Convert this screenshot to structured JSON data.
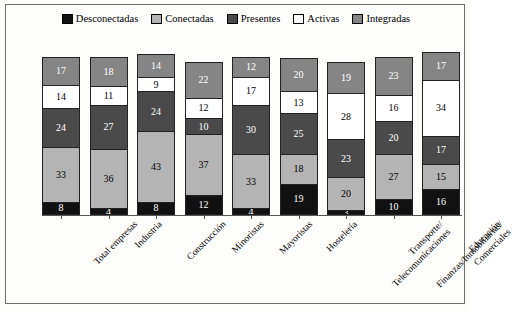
{
  "chart_data": {
    "type": "bar",
    "subtype": "stacked-bar-vertical",
    "title": "",
    "xlabel": "",
    "ylabel": "Datos en porcentaje",
    "ylim": [
      0,
      100
    ],
    "grid": false,
    "legend_position": "top-center",
    "stacking_order_bottom_to_top": [
      "Desconectadas",
      "Conectadas",
      "Presentes",
      "Activas",
      "Integradas"
    ],
    "categories": [
      "Total empresas",
      "Industria",
      "Construcción",
      "Minoristas",
      "Mayoristas",
      "Hostelería",
      "Transporte/ Telecomunicaciones",
      "Finanzas/Inmobiliarias/ Comerciales",
      "Educación"
    ],
    "series": [
      {
        "name": "Desconectadas",
        "color": "#111111",
        "values": [
          8,
          4,
          8,
          12,
          4,
          19,
          3,
          10,
          16
        ]
      },
      {
        "name": "Conectadas",
        "color": "#b4b4b4",
        "values": [
          33,
          36,
          43,
          37,
          33,
          18,
          20,
          27,
          15
        ]
      },
      {
        "name": "Presentes",
        "color": "#4a4a4a",
        "values": [
          24,
          27,
          24,
          10,
          30,
          25,
          23,
          20,
          17
        ]
      },
      {
        "name": "Activas",
        "color": "#ffffff",
        "values": [
          14,
          11,
          9,
          12,
          17,
          13,
          28,
          16,
          34
        ]
      },
      {
        "name": "Integradas",
        "color": "#858585",
        "values": [
          17,
          18,
          14,
          22,
          12,
          20,
          19,
          23,
          17
        ]
      }
    ]
  },
  "legend": {
    "items": [
      {
        "label": "Desconectadas",
        "color": "#111111"
      },
      {
        "label": "Conectadas",
        "color": "#b4b4b4"
      },
      {
        "label": "Presentes",
        "color": "#4a4a4a"
      },
      {
        "label": "Activas",
        "color": "#ffffff"
      },
      {
        "label": "Integradas",
        "color": "#858585"
      }
    ]
  },
  "axes": {
    "y_title": "Datos en porcentaje",
    "x_labels": [
      {
        "line1": "Total empresas",
        "line2": ""
      },
      {
        "line1": "Industria",
        "line2": ""
      },
      {
        "line1": "Construcción",
        "line2": ""
      },
      {
        "line1": "Minoristas",
        "line2": ""
      },
      {
        "line1": "Mayoristas",
        "line2": ""
      },
      {
        "line1": "Hostelería",
        "line2": ""
      },
      {
        "line1": "Transporte/",
        "line2": "Telecomunicaciones"
      },
      {
        "line1": "Finanzas/Inmobiliarias/",
        "line2": "Comerciales"
      },
      {
        "line1": "Educación",
        "line2": ""
      }
    ]
  }
}
